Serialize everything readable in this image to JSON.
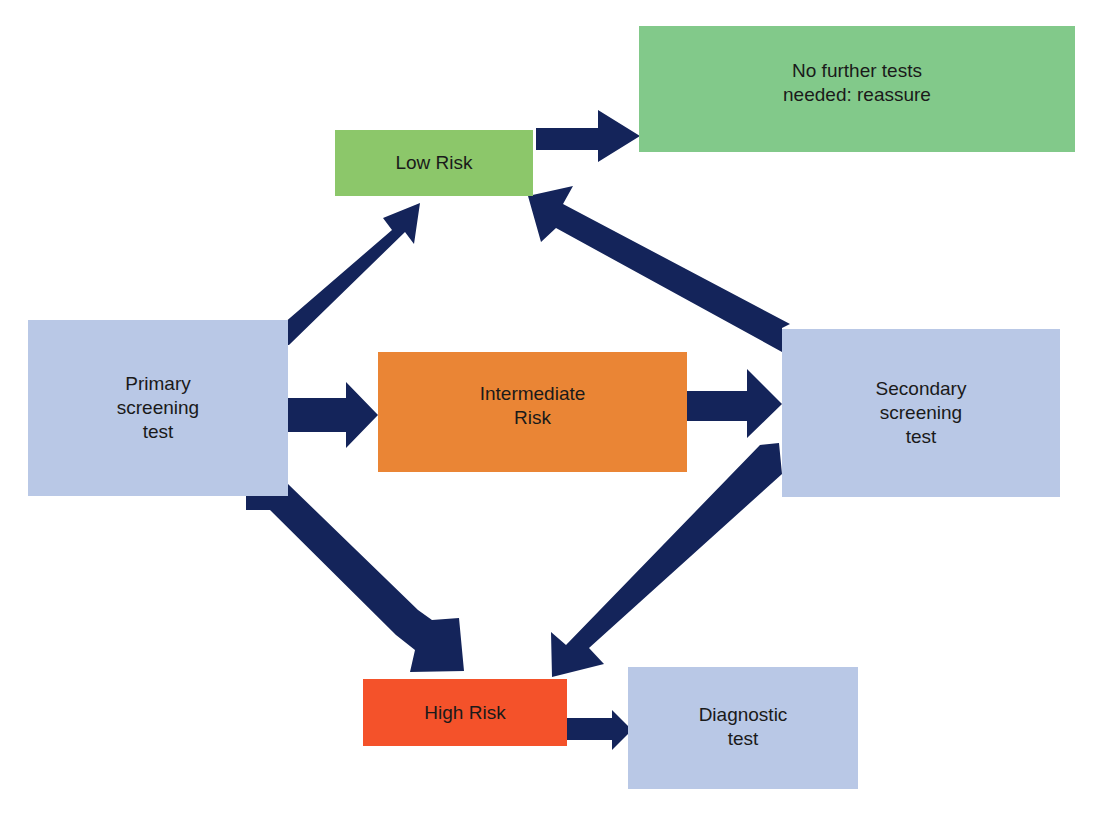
{
  "diagram": {
    "type": "flowchart",
    "colors": {
      "arrow": "#14245a",
      "screening_box": "#b9c8e6",
      "low_risk": "#8cc76a",
      "reassure": "#82c98a",
      "intermediate_risk": "#ea8535",
      "high_risk": "#f4522a",
      "text": "#1a1a1a"
    },
    "nodes": {
      "primary": {
        "label": "Primary\nscreening\ntest"
      },
      "low_risk": {
        "label": "Low Risk"
      },
      "reassure": {
        "label": "No further tests\nneeded: reassure"
      },
      "intermediate": {
        "label": "Intermediate\nRisk"
      },
      "secondary": {
        "label": "Secondary\nscreening\ntest"
      },
      "high_risk": {
        "label": "High Risk"
      },
      "diagnostic": {
        "label": "Diagnostic\ntest"
      }
    },
    "edges": [
      {
        "from": "primary",
        "to": "low_risk"
      },
      {
        "from": "primary",
        "to": "intermediate"
      },
      {
        "from": "primary",
        "to": "high_risk"
      },
      {
        "from": "low_risk",
        "to": "reassure"
      },
      {
        "from": "intermediate",
        "to": "secondary"
      },
      {
        "from": "secondary",
        "to": "low_risk"
      },
      {
        "from": "secondary",
        "to": "high_risk"
      },
      {
        "from": "high_risk",
        "to": "diagnostic"
      }
    ]
  }
}
